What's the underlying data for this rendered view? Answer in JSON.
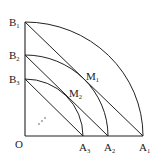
{
  "diagram": {
    "type": "geometry",
    "stroke_color": "#222222",
    "background": "#ffffff",
    "origin": {
      "label": "O",
      "x": 25,
      "y": 136
    },
    "points": {
      "A": [
        {
          "letter": "A",
          "sub": "1",
          "x": 143,
          "y": 136
        },
        {
          "letter": "A",
          "sub": "2",
          "x": 108,
          "y": 136
        },
        {
          "letter": "A",
          "sub": "3",
          "x": 83,
          "y": 136
        }
      ],
      "B": [
        {
          "letter": "B",
          "sub": "1",
          "x": 25,
          "y": 22
        },
        {
          "letter": "B",
          "sub": "2",
          "x": 25,
          "y": 55
        },
        {
          "letter": "B",
          "sub": "3",
          "x": 25,
          "y": 79
        }
      ],
      "M": [
        {
          "letter": "M",
          "sub": "1"
        },
        {
          "letter": "M",
          "sub": "2"
        }
      ]
    },
    "ellipsis": "⋰"
  }
}
